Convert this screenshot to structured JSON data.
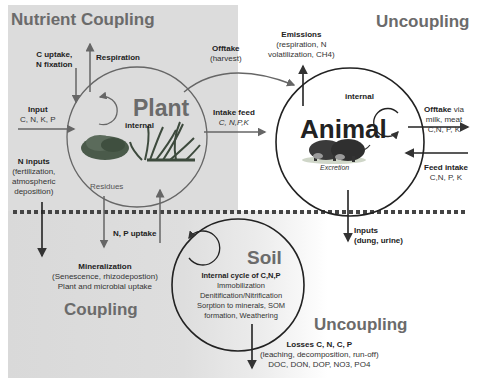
{
  "headings": {
    "nutrient_coupling": "Nutrient Coupling",
    "uncoupling_top": "Uncoupling",
    "coupling_bottom": "Coupling",
    "uncoupling_bottom": "Uncoupling"
  },
  "nodes": {
    "plant": {
      "label": "Plant",
      "internal": "internal",
      "residues": "Residues"
    },
    "animal": {
      "label": "Animal",
      "internal": "internal",
      "excretion": "Excretion"
    },
    "soil": {
      "label": "Soil",
      "cycle_title": "Internal cycle of C,N,P",
      "lines": [
        "Immobilization",
        "Denitification/Nitrification",
        "Sorption to minerals, SOM",
        "formation, Weathering"
      ]
    }
  },
  "flows": {
    "c_uptake": [
      "C uptake,",
      "N fixation"
    ],
    "respiration": "Respiration",
    "input": {
      "title": "Input",
      "detail": "C, N, K, P"
    },
    "n_inputs": {
      "title": "N inputs",
      "lines": [
        "(fertilization,",
        "atmospheric",
        "deposition)"
      ]
    },
    "offtake_harvest": {
      "title": "Offtake",
      "detail": "(harvest)"
    },
    "intake_feed": {
      "title": "Intake feed",
      "detail": "C, N,P,K"
    },
    "emissions": {
      "title": "Emissions",
      "lines": [
        "(respiration, N",
        "volatilization, CH4)"
      ]
    },
    "offtake_animal": {
      "title": "Offtake",
      "suffix": " via",
      "lines": [
        "milk, meat",
        "C,N, P, K"
      ]
    },
    "feed_intake": {
      "title": "Feed intake",
      "detail": "C,N, P, K"
    },
    "np_uptake": "N, P uptake",
    "mineralization": {
      "title": "Mineralization",
      "lines": [
        "(Senescence,  rhizodepostion)",
        "Plant and microbial uptake"
      ]
    },
    "inputs_dung": {
      "lines": [
        "Inputs",
        "(dung, urine)"
      ]
    },
    "losses": {
      "title": "Losses C,  N, C, P",
      "lines": [
        "(leaching, decomposition,  run-off)",
        "DOC, DON, DOP, NO3, PO4"
      ]
    }
  },
  "colors": {
    "panel_gray": "#dcdcdc",
    "heading_gray": "#6b6b6b",
    "line_dark": "#333333",
    "arrow_gray": "#666666",
    "dotted_line": "#444444"
  }
}
